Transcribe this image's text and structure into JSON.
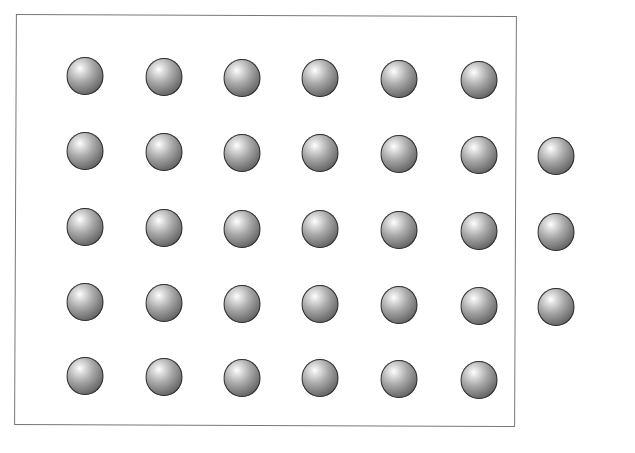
{
  "figure": {
    "colors": {
      "border": "#777777",
      "ball_dark": "#3e3e3e",
      "ball_light": "#ffffff",
      "background": "#ffffff"
    },
    "rows": [
      {
        "count": 6,
        "y": 76,
        "x": [
          85,
          164,
          242,
          320,
          399,
          479
        ]
      },
      {
        "count": 7,
        "y": 151,
        "x": [
          85,
          164,
          242,
          320,
          399,
          479,
          556
        ]
      },
      {
        "count": 7,
        "y": 227,
        "x": [
          85,
          164,
          242,
          320,
          399,
          479,
          556
        ]
      },
      {
        "count": 7,
        "y": 302,
        "x": [
          85,
          164,
          242,
          320,
          399,
          479,
          556
        ]
      },
      {
        "count": 6,
        "y": 376,
        "x": [
          85,
          164,
          242,
          320,
          399,
          479
        ]
      }
    ],
    "total_balls": 33
  }
}
